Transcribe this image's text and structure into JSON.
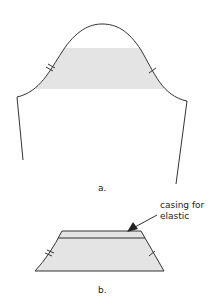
{
  "figure_a": {
    "label": "a.",
    "description": "Sleeve pattern with shaded band across the cap",
    "shade_color": "#e4e4e4",
    "line_color": "#333333"
  },
  "figure_b": {
    "label": "b.",
    "description": "Trapezoid band piece with casing line",
    "annotation_line1": "casing for",
    "annotation_line2": "elastic"
  }
}
